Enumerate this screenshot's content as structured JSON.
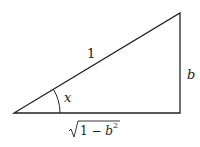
{
  "diagram": {
    "type": "right-triangle",
    "labels": {
      "hypotenuse": "1",
      "opposite": "b",
      "angle": "x",
      "adjacent_radicand_one": "1 − b",
      "adjacent_exponent": "2"
    },
    "vertices": {
      "left": [
        14,
        113
      ],
      "bottom_right": [
        180,
        113
      ],
      "top_right": [
        180,
        13
      ]
    },
    "colors": {
      "stroke": "#222222",
      "background": "#ffffff"
    }
  }
}
